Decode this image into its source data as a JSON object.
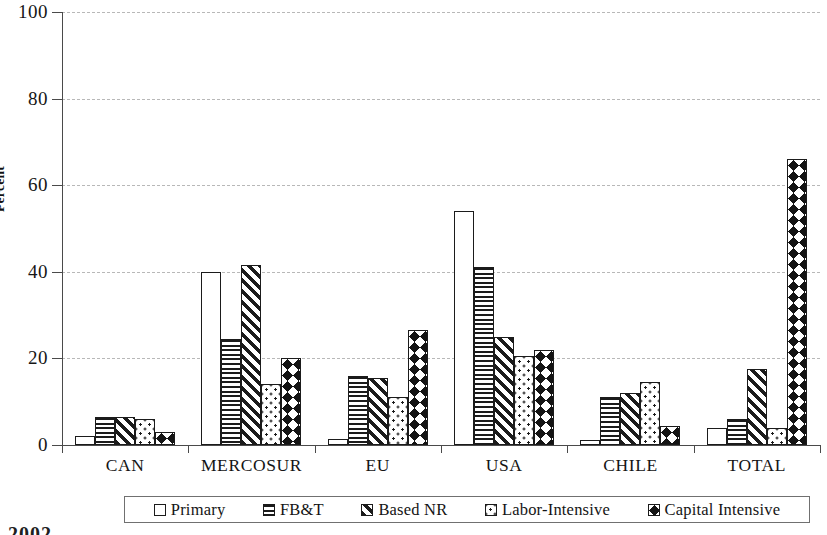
{
  "chart_data": {
    "type": "bar",
    "title": "",
    "xlabel": "",
    "ylabel": "Percent",
    "ylim": [
      0,
      100
    ],
    "yticks": [
      0,
      20,
      40,
      60,
      80,
      100
    ],
    "grid": true,
    "legend_position": "bottom",
    "orientation": "vertical",
    "categories": [
      "CAN",
      "MERCOSUR",
      "EU",
      "USA",
      "CHILE",
      "TOTAL"
    ],
    "series": [
      {
        "name": "Primary",
        "pattern": "empty",
        "values": [
          2.0,
          40.0,
          1.5,
          54.0,
          1.2,
          4.0
        ]
      },
      {
        "name": "FB&T",
        "pattern": "horizontal",
        "values": [
          6.5,
          24.5,
          16.0,
          41.0,
          11.0,
          6.0
        ]
      },
      {
        "name": "Based NR",
        "pattern": "diagonal",
        "values": [
          6.5,
          41.5,
          15.5,
          25.0,
          12.0,
          17.5
        ]
      },
      {
        "name": "Labor-Intensive",
        "pattern": "dotted",
        "values": [
          6.0,
          14.0,
          11.0,
          20.5,
          14.5,
          4.0
        ]
      },
      {
        "name": "Capital Intensive",
        "pattern": "checkered",
        "values": [
          3.0,
          20.0,
          26.5,
          22.0,
          4.5,
          66.0
        ]
      }
    ]
  },
  "axis": {
    "y_title": "Percent",
    "y_tick_labels": [
      "0",
      "20",
      "40",
      "60",
      "80",
      "100"
    ],
    "x_tick_labels": [
      "CAN",
      "MERCOSUR",
      "EU",
      "USA",
      "CHILE",
      "TOTAL"
    ]
  },
  "legend": {
    "items": [
      {
        "label": "Primary",
        "pattern": "empty"
      },
      {
        "label": "FB&T",
        "pattern": "horizontal"
      },
      {
        "label": "Based NR",
        "pattern": "diagonal"
      },
      {
        "label": "Labor-Intensive",
        "pattern": "dotted"
      },
      {
        "label": "Capital Intensive",
        "pattern": "checkered"
      }
    ]
  },
  "footer": {
    "clipped_text": "2002"
  },
  "colors": {
    "ink": "#1b1b1b",
    "axis": "#4a4a4a",
    "grid": "#b8b8b8",
    "background": "#ffffff"
  }
}
